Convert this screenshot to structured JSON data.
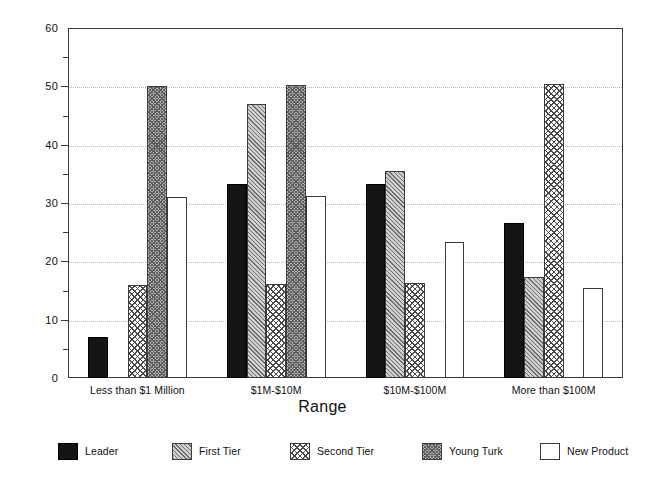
{
  "chart_data": {
    "type": "bar",
    "title": "",
    "xlabel": "Range",
    "ylabel": "",
    "ylim": [
      0,
      60
    ],
    "ytick_step": 10,
    "yminor_step": 5,
    "grid": true,
    "grid_axis": "y",
    "grid_style": "dotted",
    "legend_position": "bottom",
    "orientation": "vertical",
    "categories": [
      "Less than $1 Million",
      "$1M-$10M",
      "$10M-$100M",
      "More than $100M"
    ],
    "ytick_labels": [
      "0",
      "10",
      "20",
      "30",
      "40",
      "50",
      "60"
    ],
    "ytick_values": [
      0,
      10,
      20,
      30,
      40,
      50,
      60
    ],
    "series": [
      {
        "name": "Leader",
        "pattern": "solid-black",
        "values": [
          7.0,
          33.2,
          33.3,
          26.5
        ]
      },
      {
        "name": "First Tier",
        "pattern": "diagonal-hatch",
        "values": [
          0.0,
          47.0,
          35.5,
          17.4
        ]
      },
      {
        "name": "Second Tier",
        "pattern": "checkerboard",
        "values": [
          15.9,
          16.1,
          16.3,
          50.4
        ]
      },
      {
        "name": "Young Turk",
        "pattern": "dense-hatch",
        "values": [
          50.0,
          50.2,
          0.0,
          0.0
        ]
      },
      {
        "name": "New Product",
        "pattern": "empty-white",
        "values": [
          31.1,
          31.2,
          23.4,
          15.5
        ]
      }
    ]
  },
  "legend": {
    "items": [
      {
        "label": "Leader"
      },
      {
        "label": "First Tier"
      },
      {
        "label": "Second Tier"
      },
      {
        "label": "Young Turk"
      },
      {
        "label": "New Product"
      }
    ]
  },
  "axis": {
    "x_title": "Range"
  }
}
